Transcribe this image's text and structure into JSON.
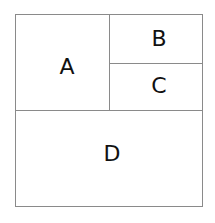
{
  "diagram": {
    "regions": [
      {
        "id": "A",
        "label": "A"
      },
      {
        "id": "B",
        "label": "B"
      },
      {
        "id": "C",
        "label": "C"
      },
      {
        "id": "D",
        "label": "D"
      }
    ],
    "line_color": "#8a8a8a"
  }
}
